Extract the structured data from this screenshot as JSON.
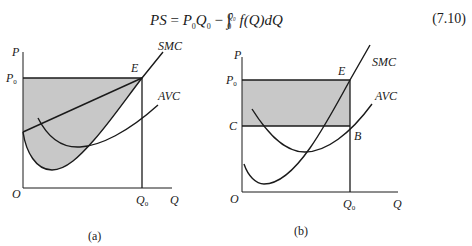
{
  "equation": {
    "lhs": "PS",
    "equals": "=",
    "term1": "P",
    "term1_sub": "0",
    "term2": "Q",
    "term2_sub": "0",
    "minus": "−",
    "integral": "∫",
    "lower_limit": "0",
    "upper_limit": "Q₀",
    "integrand": "f(Q)dQ",
    "number": "(7.10)"
  },
  "panels": [
    {
      "caption": "(a)",
      "axis_y": "P",
      "axis_x": "Q",
      "origin": "O",
      "price_label": "P",
      "price_sub": "0",
      "qty_label": "Q",
      "qty_sub": "0",
      "point_e": "E",
      "curve_smc": "SMC",
      "curve_avc": "AVC"
    },
    {
      "caption": "(b)",
      "axis_y": "P",
      "axis_x": "Q",
      "origin": "O",
      "price_label": "P",
      "price_sub": "0",
      "cost_label": "C",
      "qty_label": "Q",
      "qty_sub": "0",
      "point_e": "E",
      "point_b": "B",
      "curve_smc": "SMC",
      "curve_avc": "AVC"
    }
  ],
  "colors": {
    "shade": "#c8c8c8",
    "line": "#1a1a1a"
  }
}
